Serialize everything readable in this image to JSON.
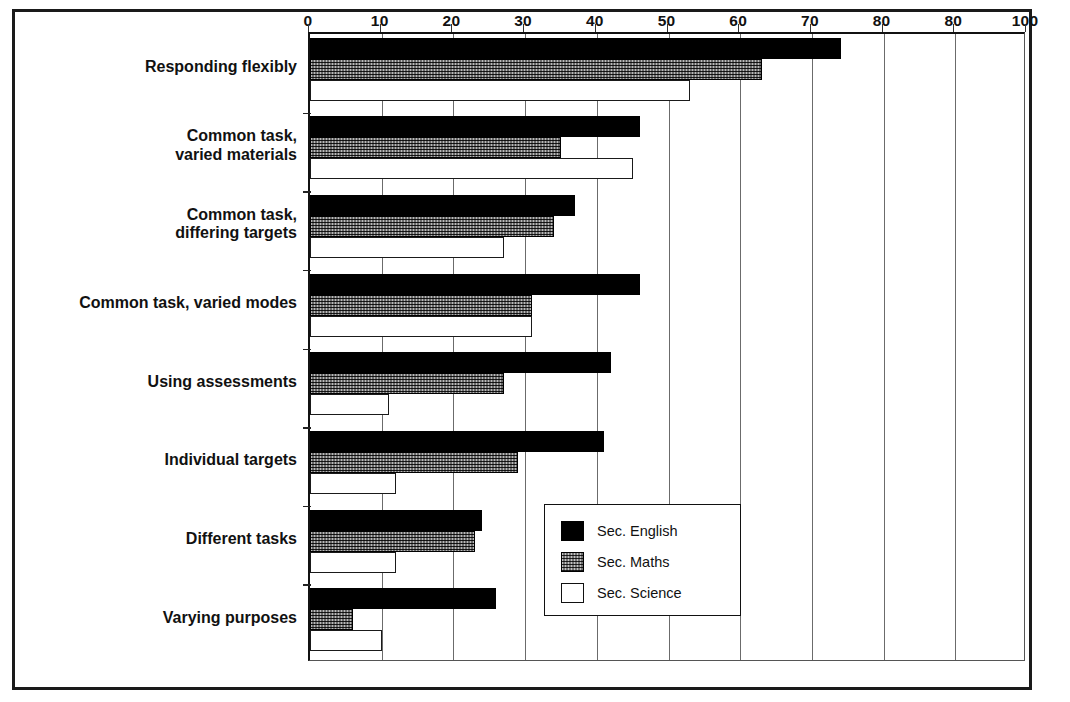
{
  "chart_data": {
    "type": "bar",
    "orientation": "horizontal",
    "title": "",
    "subtitle": "",
    "xlabel": "",
    "ylabel": "",
    "xlim": [
      0,
      100
    ],
    "grid": true,
    "grid_axis": "x",
    "axis_position": "top",
    "legend_position": "bottom-right",
    "xticks": [
      0,
      10,
      20,
      30,
      40,
      50,
      60,
      70,
      80,
      90,
      100
    ],
    "xtick_labels": [
      "0",
      "10",
      "20",
      "30",
      "40",
      "50",
      "60",
      "70",
      "80",
      "80",
      "100"
    ],
    "categories": [
      "Responding flexibly",
      "Common task,\nvaried materials",
      "Common task,\ndiffering targets",
      "Common task, varied modes",
      "Using assessments",
      "Individual targets",
      "Different tasks",
      "Varying purposes"
    ],
    "series": [
      {
        "name": "Sec. English",
        "fill": "solid-black",
        "color": "#000000",
        "values": [
          74,
          46,
          37,
          46,
          42,
          41,
          24,
          26
        ]
      },
      {
        "name": "Sec. Maths",
        "fill": "stippled-grey",
        "color": "#b9b9b9",
        "values": [
          63,
          35,
          34,
          31,
          27,
          29,
          23,
          6
        ]
      },
      {
        "name": "Sec. Science",
        "fill": "white-outline",
        "color": "#ffffff",
        "values": [
          53,
          45,
          27,
          31,
          11,
          12,
          12,
          10
        ]
      }
    ]
  },
  "legend": {
    "entries": [
      {
        "label": "Sec. English",
        "style": "english"
      },
      {
        "label": "Sec. Maths",
        "style": "maths"
      },
      {
        "label": "Sec. Science",
        "style": "science"
      }
    ]
  }
}
